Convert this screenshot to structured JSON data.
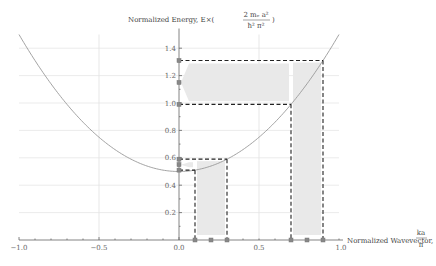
{
  "chart_data": {
    "type": "line",
    "title": "",
    "xlabel": "Normalized Wavevector, ka/π",
    "ylabel": "Normalized Energy, E×(2 m_e a² / ħ² π²)",
    "xlim": [
      -1.0,
      1.0
    ],
    "ylim": [
      0,
      1.5
    ],
    "xticks": [
      "-1.0",
      "-0.5",
      "0.0",
      "0.5",
      "1.0"
    ],
    "yticks": [
      "0.2",
      "0.4",
      "0.6",
      "0.8",
      "1.0",
      "1.2",
      "1.4"
    ],
    "grid": true,
    "series": [
      {
        "name": "E(k)",
        "formula": "E = 0.5 + k^2",
        "x": [
          -1.0,
          -0.8,
          -0.6,
          -0.4,
          -0.2,
          0.0,
          0.2,
          0.4,
          0.6,
          0.8,
          1.0
        ],
        "y": [
          1.5,
          1.14,
          0.86,
          0.66,
          0.54,
          0.5,
          0.54,
          0.66,
          0.86,
          1.14,
          1.5
        ]
      }
    ],
    "annotations": {
      "k_intervals": [
        [
          0.1,
          0.3
        ],
        [
          0.7,
          0.9
        ]
      ],
      "energy_intervals": [
        [
          0.51,
          0.59
        ],
        [
          0.99,
          1.31
        ]
      ],
      "x_markers": [
        0.1,
        0.2,
        0.3,
        0.7,
        0.8,
        0.9
      ],
      "y_markers": [
        0.51,
        0.55,
        0.59,
        0.99,
        1.15,
        1.31
      ]
    }
  },
  "labels": {
    "ylabel_prefix": "Normalized Energy, E×(",
    "ylabel_num": "2 mₑ a²",
    "ylabel_den": "ħ² π²",
    "ylabel_suffix": ")",
    "xlabel_prefix": "Normalized Wavevector, ",
    "xlabel_num": "ka",
    "xlabel_den": "π"
  }
}
